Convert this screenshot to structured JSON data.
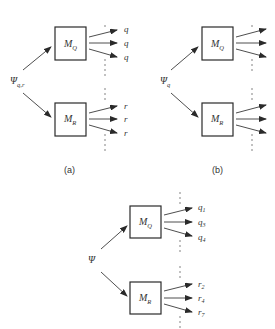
{
  "diagram": {
    "colors": {
      "line": "#3a3a3a",
      "text": "#333333",
      "background": "#ffffff"
    },
    "panels": [
      {
        "id": "a",
        "caption": "(a)",
        "source": {
          "symbol": "Ψ",
          "subscript": "q,r"
        },
        "modules": [
          {
            "name": "M",
            "subscript": "Q",
            "outputs": [
              "q",
              "q",
              "q"
            ]
          },
          {
            "name": "M",
            "subscript": "R",
            "outputs": [
              "r",
              "r",
              "r"
            ]
          }
        ]
      },
      {
        "id": "b",
        "caption": "(b)",
        "source": {
          "symbol": "Ψ",
          "subscript": "q"
        },
        "modules": [
          {
            "name": "M",
            "subscript": "Q",
            "outputs": [
              "",
              "",
              ""
            ]
          },
          {
            "name": "M",
            "subscript": "R",
            "outputs": [
              "",
              "",
              ""
            ]
          }
        ]
      },
      {
        "id": "c",
        "caption": "",
        "source": {
          "symbol": "Ψ",
          "subscript": ""
        },
        "modules": [
          {
            "name": "M",
            "subscript": "Q",
            "outputs": [
              "q",
              "q",
              "q"
            ],
            "output_subscripts": [
              "1",
              "3",
              "4"
            ]
          },
          {
            "name": "M",
            "subscript": "R",
            "outputs": [
              "r",
              "r",
              "r"
            ],
            "output_subscripts": [
              "2",
              "4",
              "7"
            ]
          }
        ]
      }
    ]
  }
}
